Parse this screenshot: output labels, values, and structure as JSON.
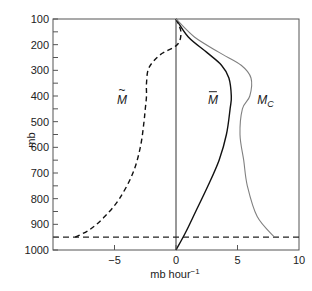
{
  "chart_data": {
    "type": "line",
    "title": "",
    "xlabel": "mb hour⁻¹",
    "ylabel": "mb",
    "xlim": [
      -10,
      10
    ],
    "ylim": [
      1000,
      100
    ],
    "y_inverted": true,
    "grid": false,
    "x_ticks": [
      -5,
      0,
      5,
      10
    ],
    "x_tick_labels": [
      "−5",
      "0",
      "5",
      "10"
    ],
    "y_ticks": [
      100,
      200,
      300,
      400,
      500,
      600,
      700,
      800,
      900,
      1000
    ],
    "y_tick_labels": [
      "100",
      "200",
      "300",
      "400",
      "500",
      "600",
      "700",
      "800",
      "900",
      "1000"
    ],
    "y_minor_ticks": [
      150,
      250,
      350,
      450,
      550,
      650,
      750,
      850,
      950
    ],
    "reference_lines": [
      {
        "type": "vertical",
        "x": 0,
        "style": "solid"
      },
      {
        "type": "horizontal",
        "y": 950,
        "style": "dashed"
      }
    ],
    "series": [
      {
        "name": "M~ (tilde M)",
        "label": "M",
        "label_accent": "~",
        "style": "dashed",
        "color": "#111111",
        "points": [
          [
            0,
            100
          ],
          [
            0.4,
            150
          ],
          [
            0.1,
            200
          ],
          [
            -1.3,
            240
          ],
          [
            -2.2,
            290
          ],
          [
            -2.4,
            350
          ],
          [
            -2.4,
            400
          ],
          [
            -2.5,
            450
          ],
          [
            -2.6,
            500
          ],
          [
            -2.9,
            600
          ],
          [
            -3.5,
            700
          ],
          [
            -4.6,
            800
          ],
          [
            -5.8,
            870
          ],
          [
            -7.0,
            920
          ],
          [
            -8.2,
            950
          ]
        ]
      },
      {
        "name": "M-bar",
        "label": "M",
        "label_accent": "¯",
        "style": "solid",
        "color": "#111111",
        "points": [
          [
            0,
            100
          ],
          [
            1.0,
            170
          ],
          [
            2.5,
            230
          ],
          [
            3.7,
            280
          ],
          [
            4.3,
            330
          ],
          [
            4.5,
            400
          ],
          [
            4.4,
            450
          ],
          [
            4.1,
            550
          ],
          [
            3.5,
            650
          ],
          [
            2.6,
            750
          ],
          [
            1.6,
            850
          ],
          [
            0.8,
            930
          ],
          [
            0,
            1000
          ]
        ]
      },
      {
        "name": "M_C",
        "label": "M",
        "label_sub": "C",
        "style": "solid",
        "color": "#808080",
        "points": [
          [
            0,
            100
          ],
          [
            1.5,
            170
          ],
          [
            3.5,
            230
          ],
          [
            5.3,
            280
          ],
          [
            6.1,
            330
          ],
          [
            6.0,
            400
          ],
          [
            5.4,
            450
          ],
          [
            5.2,
            550
          ],
          [
            5.5,
            650
          ],
          [
            5.8,
            750
          ],
          [
            6.6,
            870
          ],
          [
            8.0,
            950
          ]
        ]
      }
    ],
    "annotations": [
      {
        "text": "M~",
        "x": -4.4,
        "y": 430
      },
      {
        "text": "M̄",
        "x": 3.0,
        "y": 430
      },
      {
        "text": "M_C",
        "x": 6.6,
        "y": 430
      }
    ]
  }
}
